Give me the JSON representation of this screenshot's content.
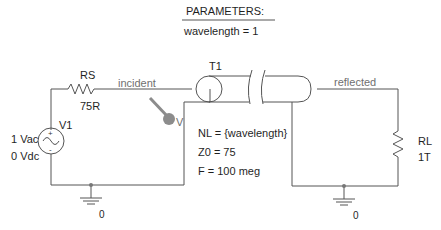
{
  "parameters": {
    "header": "PARAMETERS:",
    "value": "wavelength = 1"
  },
  "components": {
    "source_resistor": {
      "name": "RS",
      "value": "75R"
    },
    "voltage_source": {
      "name": "V1",
      "ac": "1 Vac",
      "dc": "0 Vdc"
    },
    "transmission_line": {
      "name": "T1",
      "params": [
        "NL = {wavelength}",
        "Z0 = 75",
        "F = 100 meg"
      ]
    },
    "load_resistor": {
      "name": "RL",
      "value": "1T"
    }
  },
  "nets": {
    "incident": "incident",
    "reflected": "reflected",
    "ground_left": "0",
    "ground_right": "0"
  },
  "probe": {
    "label": "V"
  },
  "colors": {
    "wire": "#555555",
    "probe": "#8c8c8c",
    "text": "#1f1f1f",
    "net_label": "#6f6f6f"
  }
}
